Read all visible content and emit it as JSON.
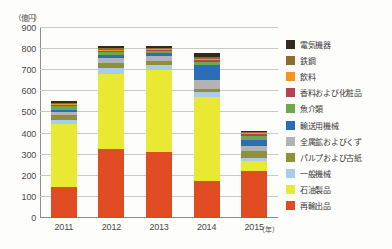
{
  "chart_data": {
    "type": "bar",
    "stacked": true,
    "title": "",
    "unit_label": "（億円）",
    "xlabel": "（年）",
    "ylabel": "",
    "categories": [
      "2011",
      "2012",
      "2013",
      "2014",
      "2015"
    ],
    "ylim": [
      0,
      900
    ],
    "yticks": [
      0,
      100,
      200,
      300,
      400,
      500,
      600,
      700,
      800,
      900
    ],
    "grid": true,
    "legend_position": "right",
    "series": [
      {
        "name": "再輸出品",
        "color": "#e04b22",
        "values": [
          148,
          327,
          313,
          176,
          223
        ]
      },
      {
        "name": "石油製品",
        "color": "#e9e832",
        "values": [
          297,
          357,
          386,
          395,
          45
        ]
      },
      {
        "name": "一般機械",
        "color": "#a7cdeb",
        "values": [
          21,
          26,
          25,
          24,
          15
        ]
      },
      {
        "name": "パルプおよび古紙",
        "color": "#8e9134",
        "values": [
          22,
          23,
          18,
          14,
          35
        ]
      },
      {
        "name": "全属鉱およびくず",
        "color": "#b3b3b3",
        "values": [
          16,
          25,
          27,
          44,
          21
        ]
      },
      {
        "name": "輸送用機械",
        "color": "#2a6fb5",
        "values": [
          8,
          12,
          12,
          70,
          30
        ]
      },
      {
        "name": "魚介類",
        "color": "#6fa84c",
        "values": [
          17,
          15,
          11,
          18,
          18
        ]
      },
      {
        "name": "香料および化粧品",
        "color": "#b2434f",
        "values": [
          5,
          7,
          5,
          6,
          9
        ]
      },
      {
        "name": "飲料",
        "color": "#f7941e",
        "values": [
          4,
          6,
          5,
          7,
          7
        ]
      },
      {
        "name": "鉄鋼",
        "color": "#8a6d2f",
        "values": [
          6,
          7,
          5,
          11,
          5
        ]
      },
      {
        "name": "電気機器",
        "color": "#332a1c",
        "values": [
          9,
          8,
          6,
          17,
          4
        ]
      }
    ],
    "totals": [
      553,
      813,
      813,
      782,
      412
    ],
    "legend_order_top_down": [
      "電気機器",
      "鉄鋼",
      "飲料",
      "香料および化粧品",
      "魚介類",
      "輸送用機械",
      "全属鉱およびくず",
      "パルプおよび古紙",
      "一般機械",
      "石油製品",
      "再輸出品"
    ]
  }
}
